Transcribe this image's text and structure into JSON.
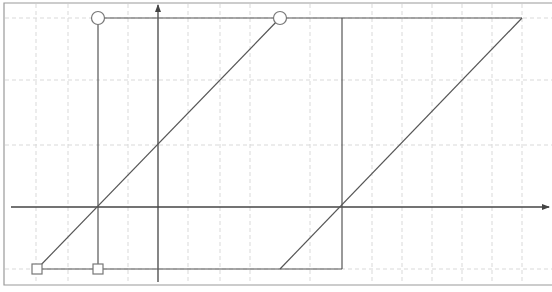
{
  "diagram": {
    "type": "hysteresis-loop",
    "canvas": {
      "width": 552,
      "height": 292
    },
    "colors": {
      "background": "#ffffff",
      "frame": "#9a9a9a",
      "grid": "#d9d9d9",
      "axis": "#444444",
      "line": "#555555",
      "marker_fill": "#ffffff",
      "marker_stroke": "#777777"
    },
    "frame": {
      "left": 4,
      "top": 3,
      "right": 552,
      "bottom": 285
    },
    "grid": {
      "vertical_x": [
        36,
        68,
        128,
        188,
        220,
        250,
        310,
        372,
        402,
        432,
        462,
        492,
        522
      ],
      "horizontal_y": [
        18,
        80,
        145,
        269
      ]
    },
    "axes": {
      "x_axis": {
        "y": 207,
        "x_start": 11,
        "x_end": 549,
        "arrow": "right"
      },
      "y_axis": {
        "x": 158,
        "y_start": 282,
        "y_end": 5,
        "arrow": "up"
      }
    },
    "segments": [
      {
        "id": "top-saturation",
        "x1": 98,
        "y1": 18,
        "x2": 522,
        "y2": 18
      },
      {
        "id": "left-vertical",
        "x1": 98,
        "y1": 18,
        "x2": 98,
        "y2": 269
      },
      {
        "id": "bottom-saturation",
        "x1": 37,
        "y1": 269,
        "x2": 342,
        "y2": 269
      },
      {
        "id": "ascending-left-diagonal",
        "x1": 37,
        "y1": 269,
        "x2": 280,
        "y2": 18
      },
      {
        "id": "right-vertical",
        "x1": 342,
        "y1": 18,
        "x2": 342,
        "y2": 269
      },
      {
        "id": "ascending-right-diagonal",
        "x1": 280,
        "y1": 269,
        "x2": 522,
        "y2": 18
      }
    ],
    "markers": [
      {
        "id": "circle-top-left",
        "shape": "circle",
        "x": 98,
        "y": 18,
        "size": 13
      },
      {
        "id": "circle-top-middle",
        "shape": "circle",
        "x": 280,
        "y": 18,
        "size": 13
      },
      {
        "id": "square-bottom-left",
        "shape": "square",
        "x": 37,
        "y": 269,
        "size": 10
      },
      {
        "id": "square-bottom-middle",
        "shape": "square",
        "x": 98,
        "y": 269,
        "size": 10
      }
    ]
  }
}
